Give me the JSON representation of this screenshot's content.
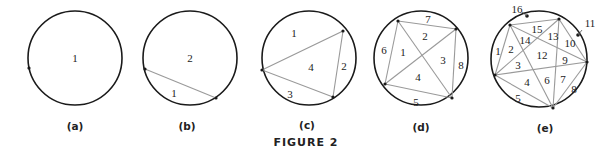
{
  "figure": {
    "title": "FIGURE 2",
    "panels": [
      {
        "caption": "(a)",
        "points": 1,
        "regions": 1,
        "labels": [
          "1"
        ]
      },
      {
        "caption": "(b)",
        "points": 2,
        "regions": 2,
        "labels": [
          "1",
          "2"
        ]
      },
      {
        "caption": "(c)",
        "points": 3,
        "regions": 4,
        "labels": [
          "1",
          "2",
          "3",
          "4"
        ]
      },
      {
        "caption": "(d)",
        "points": 4,
        "regions": 8,
        "labels": [
          "1",
          "2",
          "3",
          "4",
          "5",
          "6",
          "7",
          "8"
        ]
      },
      {
        "caption": "(e)",
        "points": 5,
        "regions": 16,
        "labels": [
          "1",
          "2",
          "3",
          "4",
          "5",
          "6",
          "7",
          "8",
          "9",
          "10",
          "11",
          "12",
          "13",
          "14",
          "15",
          "16"
        ]
      }
    ]
  },
  "colors": {
    "circle": "#1a1a1a",
    "chord": "#9a9a9a",
    "text": "#222222"
  }
}
